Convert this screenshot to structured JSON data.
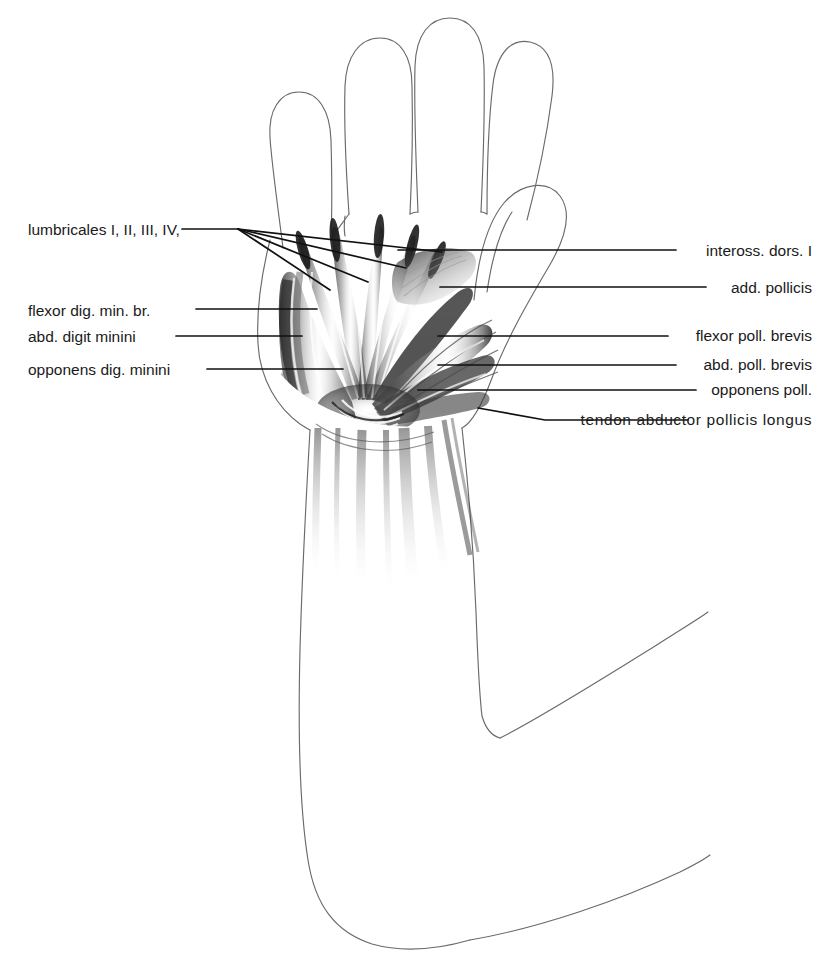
{
  "figure": {
    "style": "pencil/graphite anatomical drawing, black line art on white",
    "width": 826,
    "height": 972,
    "background_color": "#ffffff",
    "line_color": "#1a1a1a",
    "outline_color": "#5a5a5a"
  },
  "labels": {
    "left": [
      {
        "id": "lumbricales",
        "text": "lumbricales I, II, III, IV,",
        "x": 28,
        "y": 232
      },
      {
        "id": "flexor-dig-min-br",
        "text": "flexor dig. min. br.",
        "x": 28,
        "y": 313
      },
      {
        "id": "abd-digit-minini",
        "text": "abd. digit minini",
        "x": 28,
        "y": 340
      },
      {
        "id": "opponens-dig-minini",
        "text": "opponens dig. minini",
        "x": 28,
        "y": 373
      }
    ],
    "right": [
      {
        "id": "inteross-dors-i",
        "text": "inteross. dors. I",
        "x": 812,
        "y": 253
      },
      {
        "id": "add-pollicis",
        "text": "add. pollicis",
        "x": 812,
        "y": 290
      },
      {
        "id": "flexor-poll-brevis",
        "text": "flexor poll. brevis",
        "x": 812,
        "y": 338
      },
      {
        "id": "abd-poll-brevis",
        "text": "abd. poll. brevis",
        "x": 812,
        "y": 367
      },
      {
        "id": "opponens-poll",
        "text": "opponens poll.",
        "x": 812,
        "y": 391
      },
      {
        "id": "tendon-abductor-pollicis-longus",
        "text": "tendon  abductor  pollicis longus",
        "x": 812,
        "y": 421,
        "tracked": true
      }
    ]
  },
  "leader_lines": {
    "lumbricales_fan_origin": {
      "x": 238,
      "y": 229
    },
    "lumbricales_stub": {
      "x1": 182,
      "y1": 229,
      "x2": 238,
      "y2": 229
    },
    "lumbricales_targets": [
      {
        "x": 330,
        "y": 290
      },
      {
        "x": 368,
        "y": 282
      },
      {
        "x": 406,
        "y": 268
      },
      {
        "x": 442,
        "y": 252
      }
    ],
    "left_lines": [
      {
        "id": "flexor-dig-min-br",
        "x1": 196,
        "y1": 309,
        "x2": 317,
        "y2": 309
      },
      {
        "id": "abd-digit-minini",
        "x1": 176,
        "y1": 336,
        "x2": 302,
        "y2": 336
      },
      {
        "id": "opponens-dig-minini",
        "x1": 207,
        "y1": 369,
        "x2": 343,
        "y2": 369
      }
    ],
    "right_lines": [
      {
        "id": "inteross-dors-i",
        "x1": 398,
        "y1": 250,
        "x2": 676,
        "y2": 250
      },
      {
        "id": "add-pollicis",
        "x1": 440,
        "y1": 287,
        "x2": 706,
        "y2": 287
      },
      {
        "id": "flexor-poll-brevis",
        "x1": 438,
        "y1": 336,
        "x2": 668,
        "y2": 336
      },
      {
        "id": "abd-poll-brevis",
        "x1": 438,
        "y1": 365,
        "x2": 676,
        "y2": 365
      },
      {
        "id": "opponens-poll",
        "x1": 418,
        "y1": 390,
        "x2": 696,
        "y2": 390
      }
    ],
    "tendon_line": {
      "x1": 478,
      "y1": 408,
      "x2": 545,
      "y2": 420,
      "x3": 688,
      "y3": 420
    }
  },
  "anatomy": {
    "regions": [
      "index finger",
      "middle finger",
      "ring finger",
      "little finger",
      "thumb",
      "thenar eminence",
      "hypothenar eminence",
      "palm",
      "wrist",
      "forearm",
      "elbow"
    ],
    "muscle_groups": [
      "lumbricales I, II, III, IV",
      "inteross. dors. I",
      "add. pollicis",
      "flexor poll. brevis",
      "abd. poll. brevis",
      "opponens poll.",
      "tendon abductor pollicis longus",
      "flexor dig. min. br.",
      "abd. digit minini",
      "opponens dig. minini"
    ]
  }
}
